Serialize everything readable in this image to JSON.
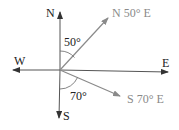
{
  "diagram": {
    "type": "compass-bearings",
    "axes": {
      "north": "N",
      "south": "S",
      "east": "E",
      "west": "W"
    },
    "bearings": [
      {
        "label": "N 50° E",
        "angle_label": "50°",
        "from": "N",
        "toward": "E",
        "degrees": 50
      },
      {
        "label": "S 70° E",
        "angle_label": "70°",
        "from": "S",
        "toward": "E",
        "degrees": 70
      }
    ],
    "colors": {
      "axis": "#333333",
      "bearing_line": "#8a8a8a",
      "bearing_text": "#8a8a8a",
      "axis_text": "#222222"
    }
  }
}
